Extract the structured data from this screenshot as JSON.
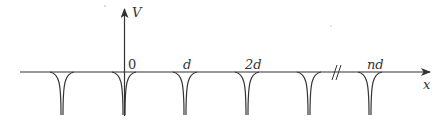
{
  "diagram": {
    "colors": {
      "line": "#333333",
      "background": "#ffffff"
    },
    "axes": {
      "vertical_label": "V",
      "horizontal_label": "x"
    },
    "tick_labels": [
      {
        "id": "origin",
        "text": "0"
      },
      {
        "id": "d",
        "text": "d"
      },
      {
        "id": "two_d",
        "text": "2d"
      },
      {
        "id": "n_d",
        "text": "nd"
      }
    ],
    "break_mark": "//",
    "wells": {
      "count": 6,
      "positions_px": [
        62,
        124,
        185,
        247,
        309,
        370
      ]
    }
  }
}
